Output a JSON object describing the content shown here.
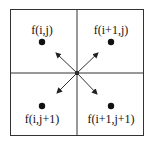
{
  "diagram": {
    "title": "",
    "cells": [
      {
        "label": "f(i,j)",
        "position": "top-left"
      },
      {
        "label": "f(i+1,j)",
        "position": "top-right"
      },
      {
        "label": "f(i,j+1)",
        "position": "bottom-left"
      },
      {
        "label": "f(i+1,j+1)",
        "position": "bottom-right"
      }
    ],
    "arrows": [
      "to-top-left",
      "to-top-right",
      "to-bottom-left",
      "to-bottom-right"
    ],
    "colors": {
      "line": "#222222",
      "background": "#ffffff"
    }
  }
}
